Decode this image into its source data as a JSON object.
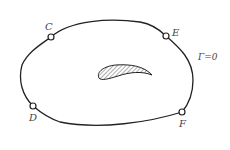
{
  "diagram": {
    "contour_label": "Γ=0",
    "points": [
      {
        "name": "C",
        "label": "C"
      },
      {
        "name": "E",
        "label": "E"
      },
      {
        "name": "D",
        "label": "D"
      },
      {
        "name": "F",
        "label": "F"
      }
    ],
    "colors": {
      "stroke": "#222222",
      "label": "#444444",
      "background": "#ffffff"
    }
  }
}
